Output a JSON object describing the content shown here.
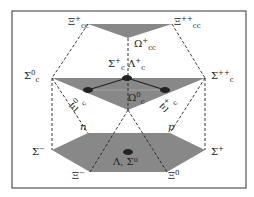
{
  "labels": {
    "xi_cc_plus": {
      "base": "Ξ",
      "sup": "+",
      "sub": "cc"
    },
    "xi_cc_pp": {
      "base": "Ξ",
      "sup": "++",
      "sub": "cc"
    },
    "omega_cc": {
      "base": "Ω",
      "sup": "+",
      "sub": "cc"
    },
    "sigma_c0": {
      "base": "Σ",
      "sup": "0",
      "sub": "c"
    },
    "sigma_c_pp": {
      "base": "Σ",
      "sup": "++",
      "sub": "c"
    },
    "sigma_lambda_c": {
      "text1": "Σ",
      "sup1": "+",
      "sub1": "c",
      "text2": "Λ",
      "sup2": "+",
      "sub2": "c"
    },
    "xi_c0": {
      "text": "Ξ",
      "sup": "0",
      "sub": "c"
    },
    "xi_c_plus": {
      "text": "Ξ",
      "sup": "+",
      "sub": "c"
    },
    "omega_c0": {
      "base": "Ω",
      "sup": "0",
      "sub": "c"
    },
    "n": "n",
    "p": "p",
    "sigma_minus": {
      "base": "Σ",
      "sup": "−"
    },
    "sigma_plus": {
      "base": "Σ",
      "sup": "+"
    },
    "xi_minus": {
      "base": "Ξ",
      "sup": "−"
    },
    "xi_zero": {
      "base": "Ξ",
      "sup": "0"
    },
    "lambda_sigma0": "Λ, Σ⁰"
  },
  "colors": {
    "fill": "#888888",
    "line": "#222222"
  }
}
